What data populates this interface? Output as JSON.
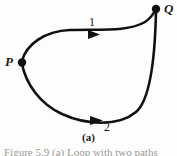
{
  "figure": {
    "caption": "(a)",
    "cut_off_caption_fragment": "Figure 5.9  (a) Loop with two paths",
    "vertices": [
      {
        "id": "P",
        "label": "P",
        "x": 21,
        "y": 62
      },
      {
        "id": "Q",
        "label": "Q",
        "x": 156,
        "y": 9
      }
    ],
    "paths": [
      {
        "id": "path-1",
        "label": "1",
        "position": "upper",
        "direction": "P-to-Q",
        "arrow_at": {
          "x": 94,
          "y": 35
        }
      },
      {
        "id": "path-2",
        "label": "2",
        "position": "lower",
        "direction": "P-to-Q",
        "arrow_at": {
          "x": 97,
          "y": 120
        }
      }
    ],
    "colors": {
      "curve": "#111111",
      "text": "#1a1a1a",
      "background": "#fdfdfc",
      "faded_text": "#9a9a9a"
    }
  }
}
